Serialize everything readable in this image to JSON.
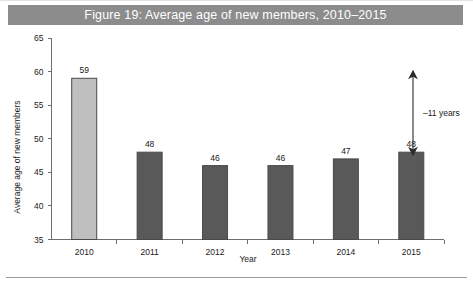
{
  "figure": {
    "title": "Figure 19: Average age of new members, 2010–2015",
    "title_bar_color": "#8c8c8c",
    "title_text_color": "#ffffff"
  },
  "chart_data": {
    "type": "bar",
    "title": "Figure 19: Average age of new members, 2010–2015",
    "xlabel": "Year",
    "ylabel": "Average age of new members",
    "categories": [
      "2010",
      "2011",
      "2012",
      "2013",
      "2014",
      "2015"
    ],
    "values": [
      59,
      48,
      46,
      46,
      47,
      48
    ],
    "value_labels": [
      "59",
      "48",
      "46",
      "46",
      "47",
      "48"
    ],
    "bar_colors": [
      "#bfbfbf",
      "#595959",
      "#595959",
      "#595959",
      "#595959",
      "#595959"
    ],
    "bar_border_color": "#4a4a4a",
    "ylim": [
      35,
      65
    ],
    "yticks": [
      35,
      40,
      45,
      50,
      55,
      60,
      65
    ],
    "ytick_labels": [
      "35",
      "40",
      "45",
      "50",
      "55",
      "60",
      "65"
    ],
    "grid": false,
    "legend": null,
    "annotations": [
      {
        "name": "age-drop-annotation",
        "text": "–11 years",
        "style": "double-headed-vertical-arrow",
        "from_value": 59,
        "to_value": 48
      }
    ]
  },
  "axis": {
    "y_title": "Average age of new members",
    "x_title": "Year",
    "y_ticks": [
      "65",
      "60",
      "55",
      "50",
      "45",
      "40",
      "35"
    ],
    "x_ticks": [
      "2010",
      "2011",
      "2012",
      "2013",
      "2014",
      "2015"
    ]
  },
  "annotation": {
    "label": "–11 years"
  }
}
